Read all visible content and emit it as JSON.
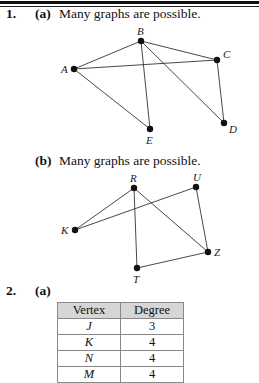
{
  "problems": [
    {
      "number": "1.",
      "parts": [
        {
          "label": "(a)",
          "text": "Many graphs are possible.",
          "graph": {
            "vertices": [
              {
                "name": "A",
                "x": 74,
                "y": 69
              },
              {
                "name": "B",
                "x": 141,
                "y": 41
              },
              {
                "name": "C",
                "x": 217,
                "y": 60
              },
              {
                "name": "D",
                "x": 224,
                "y": 123
              },
              {
                "name": "E",
                "x": 150,
                "y": 129
              }
            ],
            "edges": [
              [
                "A",
                "B"
              ],
              [
                "A",
                "C"
              ],
              [
                "A",
                "E"
              ],
              [
                "B",
                "C"
              ],
              [
                "B",
                "E"
              ],
              [
                "B",
                "D"
              ],
              [
                "C",
                "D"
              ]
            ]
          }
        },
        {
          "label": "(b)",
          "text": "Many graphs are possible.",
          "graph": {
            "vertices": [
              {
                "name": "R",
                "x": 134,
                "y": 188
              },
              {
                "name": "U",
                "x": 196,
                "y": 187
              },
              {
                "name": "K",
                "x": 75,
                "y": 230
              },
              {
                "name": "Z",
                "x": 208,
                "y": 252
              },
              {
                "name": "T",
                "x": 137,
                "y": 268
              }
            ],
            "edges": [
              [
                "K",
                "R"
              ],
              [
                "K",
                "U"
              ],
              [
                "R",
                "T"
              ],
              [
                "R",
                "Z"
              ],
              [
                "U",
                "Z"
              ],
              [
                "T",
                "Z"
              ]
            ]
          }
        }
      ]
    },
    {
      "number": "2.",
      "parts": [
        {
          "label": "(a)",
          "table": {
            "headers": [
              "Vertex",
              "Degree"
            ],
            "rows": [
              [
                "J",
                "3"
              ],
              [
                "K",
                "4"
              ],
              [
                "N",
                "4"
              ],
              [
                "M",
                "4"
              ]
            ]
          }
        }
      ]
    }
  ]
}
